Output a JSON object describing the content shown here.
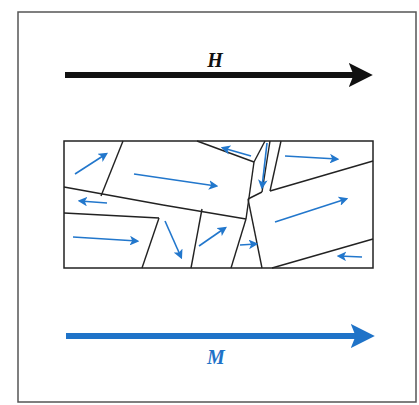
{
  "figure": {
    "frame": {
      "x": 18,
      "y": 12,
      "w": 398,
      "h": 390,
      "stroke": "#555555"
    },
    "colors": {
      "field_arrow": "#111111",
      "magnetization_arrow": "#1f73c8",
      "domain_arrow": "#2277cc",
      "boundary": "#222222"
    }
  },
  "field": {
    "label": "H",
    "description": "Applied magnetic field",
    "direction": "right",
    "label_pos": {
      "x": 215,
      "y": 67
    },
    "arrow": {
      "x1": 65,
      "y1": 75,
      "x2": 370,
      "y2": 75
    }
  },
  "magnetization": {
    "label": "M",
    "description": "Net magnetization",
    "direction": "right",
    "label_pos": {
      "x": 216,
      "y": 364
    },
    "arrow": {
      "x1": 66,
      "y1": 336,
      "x2": 372,
      "y2": 336
    }
  },
  "grain_box": {
    "x": 64,
    "y": 141,
    "w": 309,
    "h": 127,
    "boundaries": [
      [
        123,
        141,
        101,
        196
      ],
      [
        64,
        187,
        163,
        205
      ],
      [
        64,
        213,
        159,
        218
      ],
      [
        163,
        205,
        246,
        219
      ],
      [
        159,
        218,
        142,
        268
      ],
      [
        197,
        141,
        254,
        162
      ],
      [
        254,
        162,
        246,
        219
      ],
      [
        265,
        141,
        254,
        162
      ],
      [
        270,
        141,
        262,
        192
      ],
      [
        281,
        141,
        270,
        191
      ],
      [
        270,
        191,
        373,
        161
      ],
      [
        202,
        209,
        191,
        268
      ],
      [
        246,
        219,
        231,
        268
      ],
      [
        248,
        199,
        262,
        268
      ],
      [
        248,
        199,
        262,
        192
      ],
      [
        272,
        268,
        373,
        239
      ]
    ],
    "domains": [
      {
        "id": 1,
        "x1": 75,
        "y1": 174,
        "x2": 106,
        "y2": 154,
        "direction": "up-right"
      },
      {
        "id": 2,
        "x1": 134,
        "y1": 174,
        "x2": 216,
        "y2": 186,
        "direction": "right"
      },
      {
        "id": 3,
        "x1": 107,
        "y1": 203,
        "x2": 80,
        "y2": 201,
        "direction": "left"
      },
      {
        "id": 4,
        "x1": 73,
        "y1": 237,
        "x2": 137,
        "y2": 241,
        "direction": "right"
      },
      {
        "id": 5,
        "x1": 165,
        "y1": 221,
        "x2": 181,
        "y2": 257,
        "direction": "down"
      },
      {
        "id": 6,
        "x1": 199,
        "y1": 246,
        "x2": 225,
        "y2": 228,
        "direction": "up-right"
      },
      {
        "id": 7,
        "x1": 251,
        "y1": 156,
        "x2": 223,
        "y2": 148,
        "direction": "left"
      },
      {
        "id": 8,
        "x1": 267,
        "y1": 143,
        "x2": 262,
        "y2": 187,
        "direction": "down"
      },
      {
        "id": 9,
        "x1": 285,
        "y1": 156,
        "x2": 337,
        "y2": 159,
        "direction": "right"
      },
      {
        "id": 10,
        "x1": 275,
        "y1": 222,
        "x2": 346,
        "y2": 199,
        "direction": "up-right"
      },
      {
        "id": 11,
        "x1": 240,
        "y1": 245,
        "x2": 256,
        "y2": 244,
        "direction": "right"
      },
      {
        "id": 12,
        "x1": 362,
        "y1": 257,
        "x2": 339,
        "y2": 256,
        "direction": "left"
      }
    ]
  }
}
